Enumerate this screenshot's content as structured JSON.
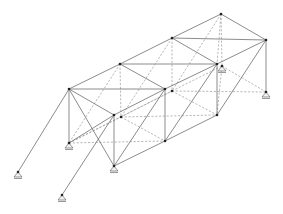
{
  "diagram": {
    "type": "3d-space-truss",
    "colors": {
      "member": "#6e6e6e",
      "hidden_member": "#9a9a9a",
      "node": "#222222",
      "background": "#ffffff"
    },
    "nodes": {
      "T1": [
        69,
        89
      ],
      "T2": [
        120,
        64
      ],
      "T3": [
        172,
        38
      ],
      "T4": [
        221,
        14
      ],
      "F1": [
        165,
        89
      ],
      "F2": [
        217,
        64
      ],
      "F3": [
        266,
        40
      ],
      "M1": [
        114,
        115
      ],
      "B1": [
        69,
        143
      ],
      "B2": [
        114,
        166
      ],
      "B3": [
        165,
        141
      ],
      "B4": [
        217,
        115
      ],
      "B5": [
        266,
        92
      ],
      "I1": [
        121,
        117
      ],
      "I2": [
        172,
        91
      ],
      "I3": [
        222,
        66
      ],
      "S1": [
        18,
        172
      ],
      "S2": [
        62,
        195
      ]
    },
    "supports": [
      "B1",
      "B2",
      "S1",
      "S2",
      "B5",
      "I3"
    ]
  }
}
